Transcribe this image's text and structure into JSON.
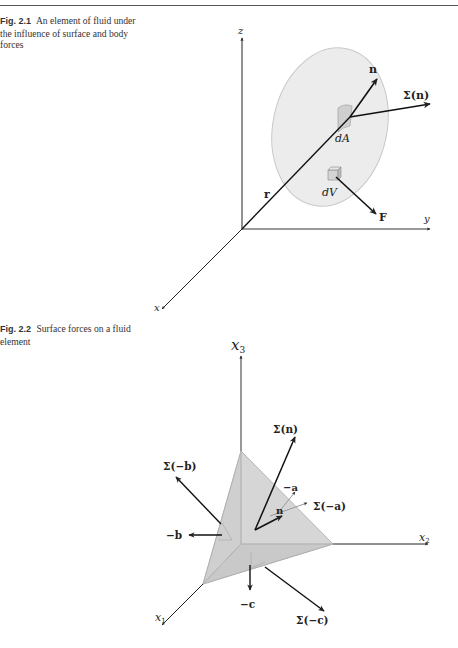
{
  "page": {
    "figures": [
      {
        "number": "Fig. 2.1",
        "caption": "An element of fluid under the influence of surface and body forces",
        "labels": {
          "z_axis": "z",
          "y_axis": "y",
          "x_axis": "x",
          "position_vector": "r",
          "normal": "n",
          "stress_vector": "Σ(n)",
          "area_element": "dA",
          "volume_element": "dV",
          "body_force": "F"
        }
      },
      {
        "number": "Fig. 2.2",
        "caption": "Surface forces on a fluid element",
        "labels": {
          "x3_axis": "x",
          "x3_sub": "3",
          "x2_axis": "x",
          "x2_sub": "2",
          "x1_axis": "x",
          "x1_sub": "1",
          "sigma_n": "Σ(n)",
          "sigma_minus_b": "Σ(−b)",
          "sigma_minus_a": "Σ(−a)",
          "sigma_minus_c": "Σ(−c)",
          "minus_a": "−a",
          "minus_b": "−b",
          "minus_c": "−c",
          "n": "n"
        }
      }
    ],
    "colors": {
      "ink": "#222222",
      "fill_gray": "#d9d9d9",
      "ellipse_fill": "#ececec",
      "ellipse_stroke": "#c8c8c8"
    }
  }
}
